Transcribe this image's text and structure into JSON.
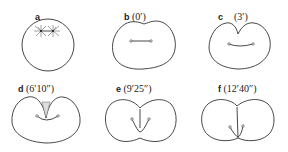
{
  "figure": {
    "panels": [
      {
        "id": "a",
        "letter": "a",
        "time": ""
      },
      {
        "id": "b",
        "letter": "b",
        "time": "(0′)"
      },
      {
        "id": "c",
        "letter": "c",
        "time": "(3′)"
      },
      {
        "id": "d",
        "letter": "d",
        "time": "(6′10″)"
      },
      {
        "id": "e",
        "letter": "e",
        "time": "(9′25″)"
      },
      {
        "id": "f",
        "letter": "f",
        "time": "(12′40″)"
      }
    ]
  }
}
